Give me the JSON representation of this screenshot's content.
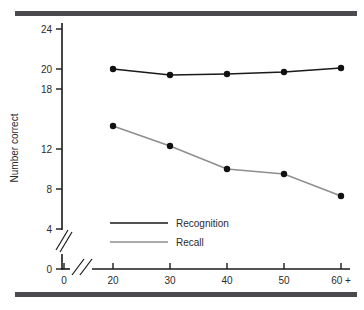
{
  "figure": {
    "background_color": "#ffffff",
    "rule_color": "#4a4a4f",
    "has_top_rule": true,
    "has_bottom_rule": true
  },
  "chart_data": {
    "type": "line",
    "title": "",
    "subtitle": "",
    "xlabel": "",
    "ylabel": "Number correct",
    "categories": [
      "20",
      "30",
      "40",
      "50",
      "60 +"
    ],
    "x_tick_labels": [
      "0",
      "20",
      "30",
      "40",
      "50",
      "60 +"
    ],
    "y_tick_labels": [
      "0",
      "4",
      "8",
      "12",
      "18",
      "20",
      "24"
    ],
    "y_ticks": [
      0,
      4,
      8,
      12,
      18,
      20,
      24
    ],
    "ylim": [
      0,
      25
    ],
    "xlim": [
      15,
      68
    ],
    "grid": false,
    "axis_break_x": true,
    "axis_break_y": true,
    "legend_position": "inside-lower-left",
    "series": [
      {
        "name": "Recognition",
        "color": "#1a1a1a",
        "marker": "circle",
        "values": [
          20.0,
          19.4,
          19.5,
          19.7,
          20.1
        ]
      },
      {
        "name": "Recall",
        "color": "#8e8e8e",
        "marker": "circle",
        "values": [
          14.3,
          12.3,
          10.0,
          9.5,
          7.3
        ]
      }
    ]
  },
  "axes": {
    "y_axis_title": "Number correct",
    "origin_label": "0"
  },
  "legend": {
    "entries": [
      {
        "label": "Recognition",
        "color": "#1a1a1a"
      },
      {
        "label": "Recall",
        "color": "#8e8e8e"
      }
    ]
  }
}
